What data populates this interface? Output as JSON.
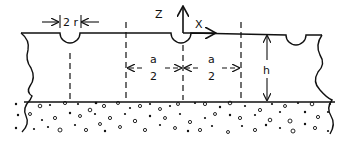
{
  "diagram": {
    "labels": {
      "width_label": "2 r",
      "z_axis": "Z",
      "x_axis": "X",
      "spacing_left_num": "a",
      "spacing_left_den": "2",
      "spacing_right_num": "a",
      "spacing_right_den": "2",
      "thickness": "h"
    },
    "colors": {
      "ink": "#111111",
      "background": "#ffffff"
    },
    "elements": {
      "notches": 3,
      "dashed_lines": 5
    }
  }
}
